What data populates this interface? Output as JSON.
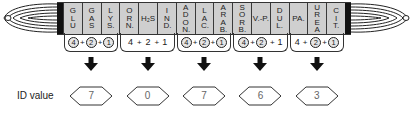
{
  "strip": {
    "tests": [
      {
        "label": "GLU"
      },
      {
        "label": "GAS"
      },
      {
        "label": "LYS."
      },
      {
        "label": "ORN."
      },
      {
        "label": "H₂S",
        "horizontal": true
      },
      {
        "label": "IND."
      },
      {
        "label": "ADON."
      },
      {
        "label": "LAC."
      },
      {
        "label": "ARAB."
      },
      {
        "label": "SORB."
      },
      {
        "label": "V.-P.",
        "horizontal": true
      },
      {
        "label": "DUL."
      },
      {
        "label": "PA.",
        "horizontal": true
      },
      {
        "label": "UREA"
      },
      {
        "label": "CIT."
      }
    ],
    "colors": {
      "well": "#cfcfcf",
      "cap": "#111111",
      "border": "#3a3a3a"
    }
  },
  "groups": [
    {
      "scores": [
        {
          "v": "4",
          "circled": true
        },
        {
          "v": "2",
          "circled": true
        },
        {
          "v": "1",
          "circled": true
        }
      ],
      "id_value": "7"
    },
    {
      "scores": [
        {
          "v": "4",
          "circled": false
        },
        {
          "v": "2",
          "circled": false
        },
        {
          "v": "1",
          "circled": false
        }
      ],
      "id_value": "0"
    },
    {
      "scores": [
        {
          "v": "4",
          "circled": true
        },
        {
          "v": "2",
          "circled": true
        },
        {
          "v": "1",
          "circled": true
        }
      ],
      "id_value": "7"
    },
    {
      "scores": [
        {
          "v": "4",
          "circled": true
        },
        {
          "v": "2",
          "circled": true
        },
        {
          "v": "1",
          "circled": false
        }
      ],
      "id_value": "6"
    },
    {
      "scores": [
        {
          "v": "4",
          "circled": false
        },
        {
          "v": "2",
          "circled": true
        },
        {
          "v": "1",
          "circled": true
        }
      ],
      "id_value": "3"
    }
  ],
  "id_label": "ID value",
  "plus": "+"
}
